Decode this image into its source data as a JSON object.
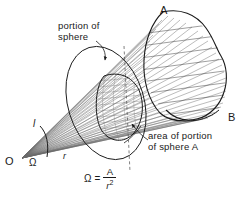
{
  "figure": {
    "background_color": "#ffffff",
    "line_color": "#1a1a1a",
    "ray_color": "#555555",
    "width": 247,
    "height": 199
  },
  "labels": {
    "portion_of_sphere": "portion of\nsphere",
    "portion_of_sphere_line1": "portion of",
    "portion_of_sphere_line2": "sphere",
    "area_of_portion_line1": "area of portion",
    "area_of_portion_line2": "of sphere A",
    "point_A": "A",
    "point_B": "B",
    "origin_O": "O",
    "solid_angle_symbol": "Ω",
    "radius_r": "r",
    "length_l": "l"
  },
  "formula": {
    "lhs": "Ω",
    "equals": "=",
    "numerator": "A",
    "denominator_base": "r",
    "denominator_exponent": "2",
    "full_text": "Ω = A / r²"
  },
  "annotations": {
    "leader_portion_of_sphere": "curved arrow pointing to spherical cap",
    "leader_area_of_portion": "arrow pointing to hatched spherical patch"
  }
}
